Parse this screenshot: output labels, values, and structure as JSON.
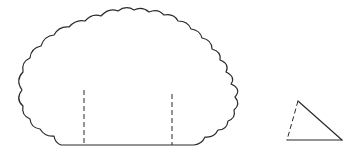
{
  "figure": {
    "stroke_color": "#2a2a2a",
    "background": "#ffffff",
    "shapes": [
      {
        "name": "scalloped-shape",
        "base": {
          "x1": 61,
          "x2": 194,
          "y": 145
        },
        "dashed_lines": [
          {
            "x": 84,
            "y1": 90,
            "y2": 145
          },
          {
            "x": 172,
            "y1": 94,
            "y2": 145
          }
        ]
      },
      {
        "name": "triangle",
        "vertices": [
          [
            298,
            101
          ],
          [
            287,
            140
          ],
          [
            342,
            140
          ]
        ],
        "dashed_edge": "left"
      }
    ]
  }
}
